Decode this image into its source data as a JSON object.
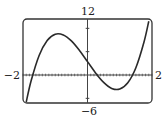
{
  "chart_data": {
    "type": "line",
    "title": "",
    "xlabel": "",
    "ylabel": "",
    "xlim": [
      -2,
      2
    ],
    "ylim": [
      -6,
      12
    ],
    "x_tick_step": 0.1,
    "y_tick_step": 5,
    "grid": false,
    "legend": "none",
    "window_labels": {
      "xmin": "−2",
      "xmax": "2",
      "ymin": "−6",
      "ymax": "12"
    },
    "series": [
      {
        "name": "f(x)",
        "color": "#2a2a2a",
        "x": [
          -1.9,
          -1.75,
          -1.5,
          -1.25,
          -1.0,
          -0.75,
          -0.5,
          -0.25,
          0.0,
          0.25,
          0.5,
          0.75,
          1.0,
          1.25,
          1.5,
          1.75,
          1.9
        ],
        "y": [
          -5.81,
          -1.29,
          4.18,
          7.39,
          8.74,
          8.58,
          7.3,
          5.26,
          2.86,
          0.45,
          -1.58,
          -2.87,
          -3.02,
          -1.68,
          1.54,
          7.0,
          11.52
        ]
      }
    ]
  }
}
